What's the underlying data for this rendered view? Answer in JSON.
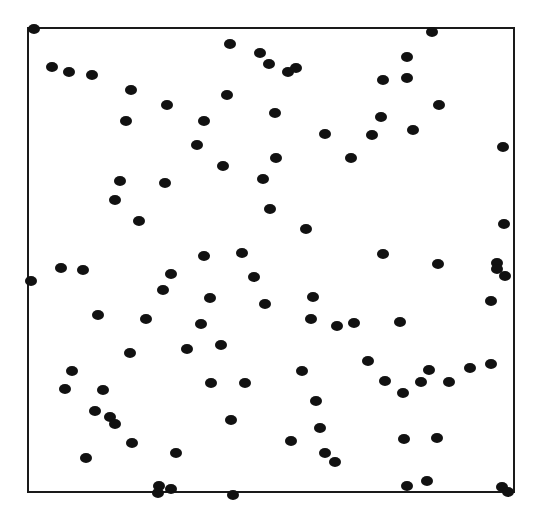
{
  "chart_data": {
    "type": "scatter",
    "title": "",
    "xlabel": "",
    "ylabel": "",
    "grid": false,
    "legend": null,
    "frame": {
      "x0": 28,
      "y0": 28,
      "x1": 514,
      "y1": 492,
      "stroke": "#1a1a1a",
      "stroke_width": 2
    },
    "marker": {
      "shape": "ellipse",
      "rx": 6,
      "ry": 5,
      "color": "#111111"
    },
    "coordinate_note": "points given in image pixel coordinates (x right, y down) within 542x516 canvas",
    "points": [
      [
        34,
        29
      ],
      [
        230,
        44
      ],
      [
        260,
        53
      ],
      [
        269,
        64
      ],
      [
        288,
        72
      ],
      [
        296,
        68
      ],
      [
        432,
        32
      ],
      [
        52,
        67
      ],
      [
        69,
        72
      ],
      [
        92,
        75
      ],
      [
        131,
        90
      ],
      [
        167,
        105
      ],
      [
        126,
        121
      ],
      [
        204,
        121
      ],
      [
        227,
        95
      ],
      [
        275,
        113
      ],
      [
        197,
        145
      ],
      [
        223,
        166
      ],
      [
        276,
        158
      ],
      [
        325,
        134
      ],
      [
        351,
        158
      ],
      [
        372,
        135
      ],
      [
        381,
        117
      ],
      [
        383,
        80
      ],
      [
        407,
        57
      ],
      [
        407,
        78
      ],
      [
        439,
        105
      ],
      [
        413,
        130
      ],
      [
        503,
        147
      ],
      [
        120,
        181
      ],
      [
        165,
        183
      ],
      [
        115,
        200
      ],
      [
        139,
        221
      ],
      [
        263,
        179
      ],
      [
        270,
        209
      ],
      [
        306,
        229
      ],
      [
        504,
        224
      ],
      [
        31,
        281
      ],
      [
        61,
        268
      ],
      [
        83,
        270
      ],
      [
        98,
        315
      ],
      [
        130,
        353
      ],
      [
        146,
        319
      ],
      [
        163,
        290
      ],
      [
        171,
        274
      ],
      [
        204,
        256
      ],
      [
        210,
        298
      ],
      [
        201,
        324
      ],
      [
        187,
        349
      ],
      [
        221,
        345
      ],
      [
        242,
        253
      ],
      [
        254,
        277
      ],
      [
        265,
        304
      ],
      [
        313,
        297
      ],
      [
        311,
        319
      ],
      [
        337,
        326
      ],
      [
        354,
        323
      ],
      [
        383,
        254
      ],
      [
        438,
        264
      ],
      [
        400,
        322
      ],
      [
        497,
        263
      ],
      [
        497,
        269
      ],
      [
        505,
        276
      ],
      [
        491,
        301
      ],
      [
        72,
        371
      ],
      [
        65,
        389
      ],
      [
        103,
        390
      ],
      [
        95,
        411
      ],
      [
        110,
        417
      ],
      [
        115,
        424
      ],
      [
        132,
        443
      ],
      [
        86,
        458
      ],
      [
        211,
        383
      ],
      [
        245,
        383
      ],
      [
        231,
        420
      ],
      [
        176,
        453
      ],
      [
        302,
        371
      ],
      [
        316,
        401
      ],
      [
        320,
        428
      ],
      [
        291,
        441
      ],
      [
        325,
        453
      ],
      [
        335,
        462
      ],
      [
        368,
        361
      ],
      [
        385,
        381
      ],
      [
        403,
        393
      ],
      [
        421,
        382
      ],
      [
        429,
        370
      ],
      [
        449,
        382
      ],
      [
        470,
        368
      ],
      [
        491,
        364
      ],
      [
        404,
        439
      ],
      [
        437,
        438
      ],
      [
        159,
        486
      ],
      [
        158,
        493
      ],
      [
        171,
        489
      ],
      [
        233,
        495
      ],
      [
        407,
        486
      ],
      [
        427,
        481
      ],
      [
        502,
        487
      ],
      [
        508,
        492
      ]
    ]
  }
}
